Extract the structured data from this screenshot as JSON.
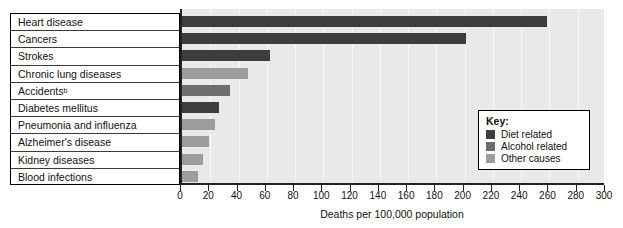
{
  "chart_data": {
    "type": "bar",
    "orientation": "horizontal",
    "title": "",
    "xlabel": "Deaths per 100,000 population",
    "ylabel": "",
    "xlim": [
      0,
      300
    ],
    "xticks": [
      0,
      20,
      40,
      60,
      80,
      100,
      120,
      140,
      160,
      180,
      200,
      220,
      240,
      260,
      280,
      300
    ],
    "grid": true,
    "legend_position": "inside-right",
    "categories": [
      "Heart disease",
      "Cancers",
      "Strokes",
      "Chronic lung diseases",
      "Accidents",
      "Diabetes mellitus",
      "Pneumonia and influenza",
      "Alzheimer's disease",
      "Kidney diseases",
      "Blood infections"
    ],
    "category_footnotes": [
      "",
      "",
      "",
      "",
      "b",
      "",
      "",
      "",
      "",
      ""
    ],
    "values": [
      258,
      201,
      62,
      47,
      34,
      26,
      23,
      19,
      15,
      11
    ],
    "categories_group": [
      "Diet related",
      "Diet related",
      "Diet related",
      "Other causes",
      "Alcohol related",
      "Diet related",
      "Other causes",
      "Other causes",
      "Other causes",
      "Other causes"
    ],
    "series": [
      {
        "name": "Deaths per 100,000 population",
        "values": [
          258,
          201,
          62,
          47,
          34,
          26,
          23,
          19,
          15,
          11
        ]
      }
    ],
    "group_colors": {
      "Diet related": "#3d3d3d",
      "Alcohol related": "#6d6d6d",
      "Other causes": "#9d9d9d"
    },
    "plot_background": "#e9e9e9"
  },
  "legend": {
    "title": "Key:",
    "items": [
      {
        "label": "Diet related",
        "color": "#3d3d3d"
      },
      {
        "label": "Alcohol related",
        "color": "#6d6d6d"
      },
      {
        "label": "Other causes",
        "color": "#9d9d9d"
      }
    ]
  },
  "axis": {
    "x_title": "Deaths per 100,000 population",
    "tick_labels": [
      "0",
      "20",
      "40",
      "60",
      "80",
      "100",
      "120",
      "140",
      "160",
      "180",
      "200",
      "220",
      "240",
      "260",
      "280",
      "300"
    ]
  }
}
